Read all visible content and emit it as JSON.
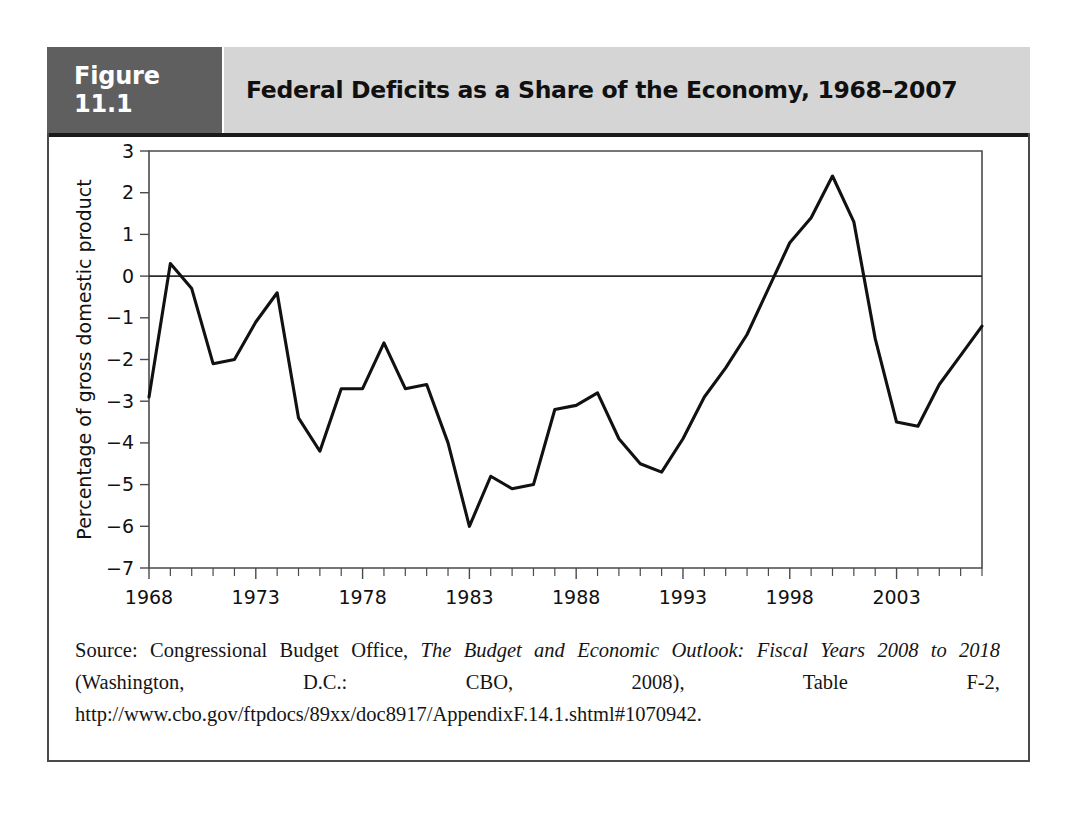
{
  "figure": {
    "tag": "Figure 11.1",
    "title": "Federal Deficits as a Share of the Economy, 1968–2007",
    "tag_background": "#5f5f5f",
    "title_background": "#d5d5d5"
  },
  "source": {
    "prefix": "Source: Congressional Budget Office, ",
    "italic_title": "The Budget and Economic Outlook: Fiscal Years 2008 to 2018",
    "suffix": " (Washington, D.C.: CBO, 2008), Table F-2, http://www.cbo.gov/ftpdocs/89xx/doc8917/AppendixF.14.1.shtml#1070942.",
    "full_text": "Source: Congressional Budget Office, The Budget and Economic Outlook: Fiscal Years 2008 to 2018 (Washington, D.C.: CBO, 2008), Table F-2, http://www.cbo.gov/ftpdocs/89xx/doc8917/AppendixF.14.1.shtml#1070942."
  },
  "chart_data": {
    "type": "line",
    "title": "Federal Deficits as a Share of the Economy, 1968–2007",
    "xlabel": "",
    "ylabel": "Percentage of gross domestic product",
    "xlim": [
      1968,
      2007
    ],
    "ylim": [
      -7,
      3
    ],
    "grid": false,
    "legend": null,
    "y_ticks": [
      3,
      2,
      1,
      0,
      -1,
      -2,
      -3,
      -4,
      -5,
      -6,
      -7
    ],
    "y_tick_labels": [
      "3",
      "2",
      "1",
      "0",
      "−1",
      "−2",
      "−3",
      "−4",
      "−5",
      "−6",
      "−7"
    ],
    "x_ticks_major": [
      1968,
      1973,
      1978,
      1983,
      1988,
      1993,
      1998,
      2003
    ],
    "x_tick_labels": [
      "1968",
      "1973",
      "1978",
      "1983",
      "1988",
      "1993",
      "1998",
      "2003"
    ],
    "x_minor_step": 1,
    "zero_reference_line": 0,
    "line_color": "#111111",
    "x": [
      1968,
      1969,
      1970,
      1971,
      1972,
      1973,
      1974,
      1975,
      1976,
      1977,
      1978,
      1979,
      1980,
      1981,
      1982,
      1983,
      1984,
      1985,
      1986,
      1987,
      1988,
      1989,
      1990,
      1991,
      1992,
      1993,
      1994,
      1995,
      1996,
      1997,
      1998,
      1999,
      2000,
      2001,
      2002,
      2003,
      2004,
      2005,
      2006,
      2007
    ],
    "values": [
      -2.9,
      0.3,
      -0.3,
      -2.1,
      -2.0,
      -1.1,
      -0.4,
      -3.4,
      -4.2,
      -2.7,
      -2.7,
      -1.6,
      -2.7,
      -2.6,
      -4.0,
      -6.0,
      -4.8,
      -5.1,
      -5.0,
      -3.2,
      -3.1,
      -2.8,
      -3.9,
      -4.5,
      -4.7,
      -3.9,
      -2.9,
      -2.2,
      -1.4,
      -0.3,
      0.8,
      1.4,
      2.4,
      1.3,
      -1.5,
      -3.5,
      -3.6,
      -2.6,
      -1.9,
      -1.2
    ],
    "units": "percent of GDP"
  }
}
